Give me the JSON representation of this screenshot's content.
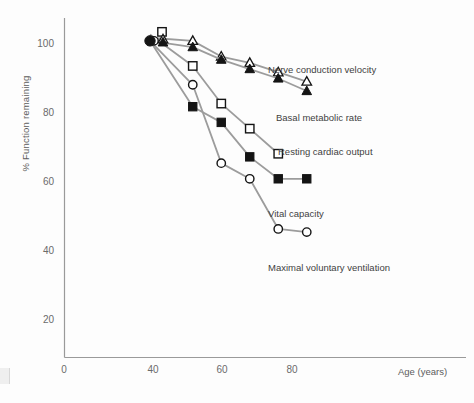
{
  "chart_data": {
    "type": "line",
    "title": "",
    "xlabel": "Age (years)",
    "ylabel": "% Function remaining",
    "xlim": [
      0,
      95
    ],
    "ylim": [
      0,
      108
    ],
    "xticks": [
      0,
      40,
      60,
      80
    ],
    "yticks": [
      20,
      40,
      60,
      80,
      100
    ],
    "grid": false,
    "legend_position": "inline-annotations",
    "series": [
      {
        "name": "Nerve conduction velocity",
        "marker": "open-triangle",
        "color": "#1a1a1a",
        "x": [
          30,
          45,
          55,
          65,
          75,
          85
        ],
        "values": [
          102,
          101,
          96,
          94,
          91,
          88
        ],
        "label_x": 268,
        "label_y": 70
      },
      {
        "name": "Basal metabolic rate",
        "marker": "filled-triangle",
        "color": "#1a1a1a",
        "x": [
          30,
          45,
          55,
          65,
          75,
          85
        ],
        "values": [
          101,
          99,
          95,
          92,
          89,
          85
        ],
        "label_x": 275,
        "label_y": 118
      },
      {
        "name": "Resting cardiac output",
        "marker": "open-square",
        "color": "#1a1a1a",
        "x": [
          30,
          45,
          55,
          65,
          75
        ],
        "values": [
          103,
          93,
          81,
          73,
          65
        ],
        "label_x": 272,
        "label_y": 152
      },
      {
        "name": "Vital capacity",
        "marker": "filled-square",
        "color": "#1a1a1a",
        "x": [
          30,
          45,
          55,
          65,
          75,
          85
        ],
        "values": [
          101,
          80,
          75,
          64,
          57,
          57
        ],
        "label_x": 268,
        "label_y": 214
      },
      {
        "name": "Maximal voluntary ventilation",
        "marker": "open-circle",
        "color": "#1a1a1a",
        "x": [
          30,
          45,
          55,
          65,
          75,
          85
        ],
        "values": [
          101,
          87,
          62,
          57,
          41,
          40
        ],
        "label_x": 268,
        "label_y": 268
      }
    ],
    "origin_marker": {
      "name": "common-origin-point",
      "marker": "filled-circle",
      "x": 30,
      "y": 101
    }
  },
  "axes": {
    "x_tick_labels": [
      "0",
      "40",
      "60",
      "80"
    ],
    "y_tick_labels": [
      "100",
      "80",
      "60",
      "40",
      "20"
    ],
    "x_axis_label": "Age (years)",
    "y_axis_label": "% Function remaining"
  }
}
